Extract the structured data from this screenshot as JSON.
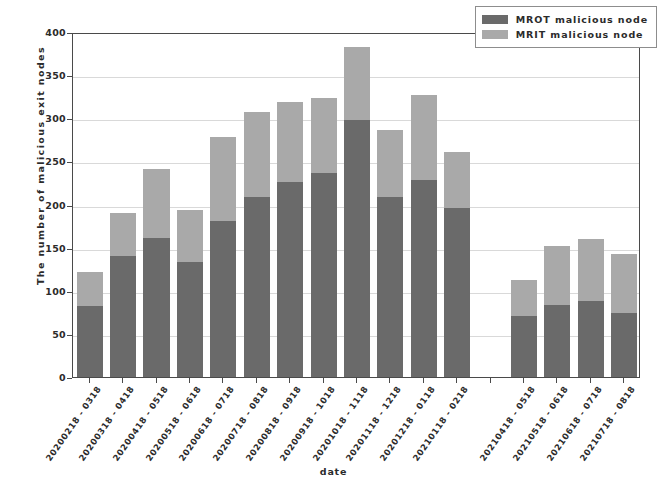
{
  "chart_data": {
    "type": "bar",
    "subtype": "stacked-vertical",
    "title": "",
    "xlabel": "date",
    "ylabel": "The number of malicious exit nodes",
    "ylim": [
      0,
      400
    ],
    "ytick_labels": [
      "0",
      "50",
      "100",
      "150",
      "200",
      "250",
      "300",
      "350",
      "400"
    ],
    "ytick_values": [
      0,
      50,
      100,
      150,
      200,
      250,
      300,
      350,
      400
    ],
    "grid": true,
    "grid_axis": "y",
    "legend_position": "upper right",
    "categories": [
      "20200218 - 0318",
      "20200318 - 0418",
      "20200418 - 0518",
      "20200518 - 0618",
      "20200618 - 0718",
      "20200718 - 0818",
      "20200818 - 0918",
      "20200918 - 1018",
      "20201018 - 1118",
      "20201118 - 1218",
      "20201218 - 0118",
      "20210118 - 0218",
      "20210418 - 0518",
      "20210518 - 0618",
      "20210618 - 0718",
      "20210718 - 0818"
    ],
    "series": [
      {
        "name": "MROT malicious node",
        "color": "#6a6a6a",
        "values": [
          82,
          140,
          161,
          133,
          181,
          209,
          226,
          236,
          298,
          209,
          229,
          196,
          71,
          84,
          88,
          74
        ]
      },
      {
        "name": "MRIT malicious node",
        "color": "#a9a9a9",
        "values": [
          40,
          50,
          80,
          61,
          97,
          98,
          93,
          87,
          85,
          77,
          98,
          65,
          42,
          68,
          72,
          69
        ]
      }
    ],
    "totals": [
      122,
      190,
      241,
      194,
      278,
      307,
      319,
      323,
      383,
      286,
      327,
      261,
      113,
      152,
      160,
      143
    ],
    "slot_count": 17,
    "missing_slot_indices": [
      12
    ]
  },
  "legend": {
    "entries": [
      {
        "label": "MROT malicious node",
        "color": "#6a6a6a"
      },
      {
        "label": "MRIT malicious node",
        "color": "#a9a9a9"
      }
    ]
  },
  "axes": {
    "x_title": "date",
    "y_title": "The number of malicious exit nodes"
  }
}
